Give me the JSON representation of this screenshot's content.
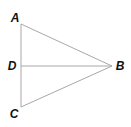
{
  "diagram": {
    "type": "geometry",
    "line_color": "#a8a8a8",
    "label_color": "#111111",
    "points": {
      "A": {
        "label": "A",
        "x": 21,
        "y": 24,
        "label_x": 15,
        "label_y": 22
      },
      "B": {
        "label": "B",
        "x": 112,
        "y": 66,
        "label_x": 120,
        "label_y": 70
      },
      "C": {
        "label": "C",
        "x": 21,
        "y": 107,
        "label_x": 14,
        "label_y": 118
      },
      "D": {
        "label": "D",
        "x": 21,
        "y": 66,
        "label_x": 12,
        "label_y": 70
      }
    },
    "segments": [
      [
        "A",
        "B"
      ],
      [
        "B",
        "C"
      ],
      [
        "A",
        "C"
      ],
      [
        "D",
        "B"
      ]
    ]
  }
}
